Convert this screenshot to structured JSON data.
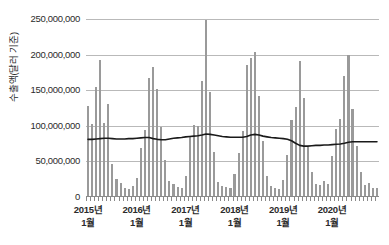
{
  "chart_data": {
    "type": "bar",
    "title": "",
    "xlabel": "",
    "ylabel": "수출액(달러 기준)",
    "ylim": [
      0,
      250000000
    ],
    "ytick_values": [
      0,
      50000000,
      100000000,
      150000000,
      200000000,
      250000000
    ],
    "ytick_labels": [
      "0",
      "50,000,000",
      "100,000,000",
      "150,000,000",
      "200,000,000",
      "250,000,000"
    ],
    "grid": true,
    "legend": "none",
    "xtick_labels": [
      {
        "year": "2015년",
        "month": "1월"
      },
      {
        "year": "2016년",
        "month": "1월"
      },
      {
        "year": "2017년",
        "month": "1월"
      },
      {
        "year": "2018년",
        "month": "1월"
      },
      {
        "year": "2019년",
        "month": "1월"
      },
      {
        "year": "2020년",
        "month": "1월"
      }
    ],
    "categories": [
      "2015-01",
      "2015-02",
      "2015-03",
      "2015-04",
      "2015-05",
      "2015-06",
      "2015-07",
      "2015-08",
      "2015-09",
      "2015-10",
      "2015-11",
      "2015-12",
      "2016-01",
      "2016-02",
      "2016-03",
      "2016-04",
      "2016-05",
      "2016-06",
      "2016-07",
      "2016-08",
      "2016-09",
      "2016-10",
      "2016-11",
      "2016-12",
      "2017-01",
      "2017-02",
      "2017-03",
      "2017-04",
      "2017-05",
      "2017-06",
      "2017-07",
      "2017-08",
      "2017-09",
      "2017-10",
      "2017-11",
      "2017-12",
      "2018-01",
      "2018-02",
      "2018-03",
      "2018-04",
      "2018-05",
      "2018-06",
      "2018-07",
      "2018-08",
      "2018-09",
      "2018-10",
      "2018-11",
      "2018-12",
      "2019-01",
      "2019-02",
      "2019-03",
      "2019-04",
      "2019-05",
      "2019-06",
      "2019-07",
      "2019-08",
      "2019-09",
      "2019-10",
      "2019-11",
      "2019-12",
      "2020-01",
      "2020-02",
      "2020-03",
      "2020-04",
      "2020-05",
      "2020-06",
      "2020-07",
      "2020-08",
      "2020-09",
      "2020-10",
      "2020-11",
      "2020-12"
    ],
    "series": [
      {
        "name": "수출액",
        "type": "bar",
        "color": "#9a9a9a",
        "values": [
          128000000,
          103000000,
          155000000,
          193000000,
          104000000,
          131000000,
          46000000,
          25000000,
          20000000,
          12000000,
          11000000,
          16000000,
          27000000,
          69000000,
          94000000,
          167000000,
          182000000,
          152000000,
          98000000,
          52000000,
          22000000,
          18000000,
          14000000,
          13000000,
          29000000,
          86000000,
          101000000,
          100000000,
          163000000,
          249000000,
          147000000,
          63000000,
          21000000,
          16000000,
          14000000,
          13000000,
          33000000,
          62000000,
          93000000,
          186000000,
          195000000,
          204000000,
          142000000,
          78000000,
          30000000,
          16000000,
          12000000,
          11000000,
          24000000,
          59000000,
          108000000,
          126000000,
          191000000,
          139000000,
          70000000,
          35000000,
          18000000,
          17000000,
          22000000,
          18000000,
          57000000,
          95000000,
          109000000,
          170000000,
          199000000,
          123000000,
          72000000,
          35000000,
          17000000,
          19000000,
          13000000,
          12000000
        ]
      },
      {
        "name": "이동평균",
        "type": "line",
        "color": "#1a1a1a",
        "values": [
          81000000,
          81000000,
          81500000,
          82000000,
          82500000,
          82500000,
          82000000,
          81500000,
          81500000,
          81500000,
          82000000,
          82000000,
          82500000,
          83000000,
          83500000,
          83500000,
          82000000,
          81000000,
          80500000,
          80500000,
          81500000,
          82500000,
          83000000,
          83500000,
          84500000,
          85000000,
          85500000,
          86000000,
          87000000,
          88500000,
          88000000,
          87000000,
          86000000,
          85000000,
          84500000,
          84000000,
          84000000,
          84000000,
          84000000,
          85000000,
          87000000,
          88000000,
          87000000,
          85500000,
          84500000,
          83500000,
          83000000,
          82500000,
          82000000,
          81000000,
          79000000,
          75500000,
          72500000,
          71500000,
          71500000,
          72000000,
          72500000,
          72500000,
          73000000,
          73000000,
          73500000,
          74000000,
          74500000,
          75500000,
          77000000,
          77500000,
          77500000,
          77500000,
          77500000,
          77500000,
          77500000,
          77500000
        ]
      }
    ]
  }
}
